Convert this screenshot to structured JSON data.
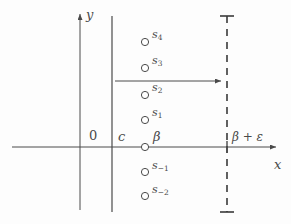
{
  "figure": {
    "background_color": "#fdfdfd",
    "stroke_color": "#4a4a4a",
    "axes": {
      "x_label": "x",
      "y_label": "y",
      "origin_label": "0",
      "x_axis_y": 147,
      "y_axis_x": 80
    },
    "vertical_lines": [
      {
        "name": "c-line",
        "label": "c",
        "x": 112,
        "style": "solid"
      },
      {
        "name": "beta-plus-epsilon-line",
        "label": "β + ε",
        "x": 227,
        "style": "dashed"
      }
    ],
    "points": [
      {
        "name": "s4",
        "label_base": "s",
        "label_sub": "4",
        "x": 145,
        "y": 42,
        "on_axis": false
      },
      {
        "name": "s3",
        "label_base": "s",
        "label_sub": "3",
        "x": 145,
        "y": 68,
        "on_axis": false
      },
      {
        "name": "s2",
        "label_base": "s",
        "label_sub": "2",
        "x": 145,
        "y": 95,
        "on_axis": false
      },
      {
        "name": "s1",
        "label_base": "s",
        "label_sub": "1",
        "x": 145,
        "y": 120,
        "on_axis": false
      },
      {
        "name": "beta",
        "label_base": "β",
        "label_sub": "",
        "x": 145,
        "y": 147,
        "on_axis": true
      },
      {
        "name": "s-1",
        "label_base": "s",
        "label_sub": "−1",
        "x": 145,
        "y": 172,
        "on_axis": false
      },
      {
        "name": "s-2",
        "label_base": "s",
        "label_sub": "−2",
        "x": 145,
        "y": 196,
        "on_axis": false
      }
    ],
    "arrow": {
      "name": "horizontal-shift-arrow",
      "x_start": 115,
      "x_end": 225,
      "y": 81
    }
  }
}
